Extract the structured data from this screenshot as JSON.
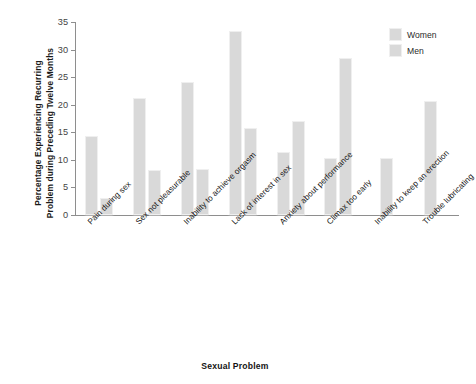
{
  "chart_data": {
    "type": "bar",
    "title": "",
    "xlabel": "Sexual Problem",
    "ylabel_lines": [
      "Percentage Experiencing Recurring",
      "Problem during Preceding Twelve Months"
    ],
    "ylabel": "Percentage Experiencing Recurring Problem during Preceding Twelve Months",
    "ylim": [
      0,
      35
    ],
    "yticks": [
      0,
      5,
      10,
      15,
      20,
      25,
      30,
      35
    ],
    "grid": false,
    "legend_position": "top-right",
    "categories": [
      "Pain during sex",
      "Sex not pleasurable",
      "Inability to achieve orgasm",
      "Lack of interest in sex",
      "Anxiety about performance",
      "Climax too early",
      "Inability to keep an erection",
      "Trouble lubricating"
    ],
    "series": [
      {
        "name": "Women",
        "color": "#d9d9d9",
        "values": [
          14.4,
          21.2,
          24.1,
          33.4,
          11.5,
          10.3,
          null,
          20.6
        ]
      },
      {
        "name": "Men",
        "color": "#d9d9d9",
        "values": [
          3.0,
          8.1,
          8.3,
          15.8,
          17.0,
          28.5,
          10.4,
          null
        ]
      }
    ]
  },
  "legend": {
    "items": [
      {
        "label": "Women"
      },
      {
        "label": "Men"
      }
    ]
  },
  "axis": {
    "y_ticks": [
      "0",
      "5",
      "10",
      "15",
      "20",
      "25",
      "30",
      "35"
    ],
    "x_title": "Sexual Problem",
    "y_title_line1": "Percentage Experiencing Recurring",
    "y_title_line2": "Problem during Preceding Twelve Months"
  }
}
